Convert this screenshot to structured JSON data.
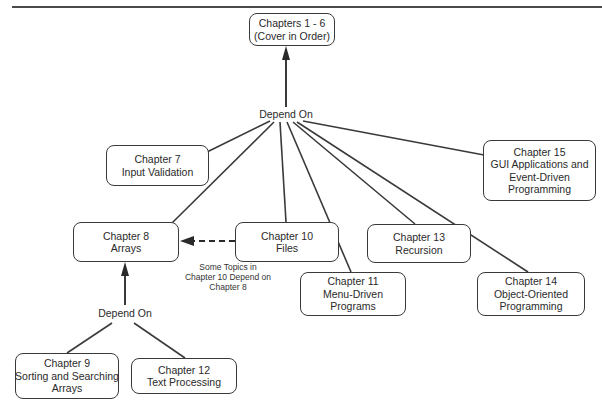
{
  "diagram": {
    "title": "",
    "nodes": {
      "ch1_6": {
        "line1": "Chapters 1 - 6",
        "line2": "(Cover in Order)"
      },
      "ch7": {
        "line1": "Chapter 7",
        "line2": "Input Validation"
      },
      "ch8": {
        "line1": "Chapter 8",
        "line2": "Arrays"
      },
      "ch9": {
        "line1": "Chapter 9",
        "line2": "Sorting and Searching",
        "line3": "Arrays"
      },
      "ch10": {
        "line1": "Chapter 10",
        "line2": "Files"
      },
      "ch11": {
        "line1": "Chapter 11",
        "line2": "Menu-Driven",
        "line3": "Programs"
      },
      "ch12": {
        "line1": "Chapter 12",
        "line2": "Text Processing"
      },
      "ch13": {
        "line1": "Chapter 13",
        "line2": "Recursion"
      },
      "ch14": {
        "line1": "Chapter 14",
        "line2": "Object-Oriented",
        "line3": "Programming"
      },
      "ch15": {
        "line1": "Chapter 15",
        "line2": "GUI Applications and",
        "line3": "Event-Driven",
        "line4": "Programming"
      }
    },
    "hub_labels": {
      "top": "Depend On",
      "bottom": "Depend On"
    },
    "note": {
      "line1": "Some Topics in",
      "line2": "Chapter 10 Depend on",
      "line3": "Chapter 8"
    },
    "edges": [
      {
        "from": "hub_top",
        "to": "ch1_6",
        "style": "solid-arrow"
      },
      {
        "from": "hub_top",
        "to": "ch7",
        "style": "line"
      },
      {
        "from": "hub_top",
        "to": "ch8",
        "style": "line"
      },
      {
        "from": "hub_top",
        "to": "ch10",
        "style": "line"
      },
      {
        "from": "hub_top",
        "to": "ch11",
        "style": "line"
      },
      {
        "from": "hub_top",
        "to": "ch13",
        "style": "line"
      },
      {
        "from": "hub_top",
        "to": "ch14",
        "style": "line"
      },
      {
        "from": "hub_top",
        "to": "ch15",
        "style": "line"
      },
      {
        "from": "ch10",
        "to": "ch8",
        "style": "dashed-arrow"
      },
      {
        "from": "hub_bottom",
        "to": "ch8",
        "style": "solid-arrow"
      },
      {
        "from": "hub_bottom",
        "to": "ch9",
        "style": "line"
      },
      {
        "from": "hub_bottom",
        "to": "ch12",
        "style": "line"
      }
    ],
    "colors": {
      "stroke": "#3a3a3a",
      "text": "#2a2a2a",
      "background": "#ffffff"
    }
  }
}
